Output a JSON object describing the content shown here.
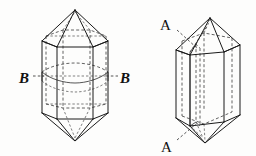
{
  "figure": {
    "background_color": "#fdfdfc",
    "line_color": "#1a1a1a",
    "hidden_line_color": "#3a3a3a",
    "labels": {
      "left_section_left": "B",
      "left_section_right": "B",
      "right_section_top": "A",
      "right_section_bottom": "A"
    },
    "left_crystal": {
      "name": "crystal-with-horizontal-section",
      "section_label": "B",
      "section_orientation": "horizontal",
      "apex_top": [
        75,
        10
      ],
      "apex_bottom": [
        75,
        141
      ],
      "prism_left_outer": 42,
      "prism_right_outer": 108,
      "prism_front_left": 57,
      "prism_front_right": 93,
      "prism_top_y": 41,
      "prism_bottom_y": 113,
      "section_y": 76
    },
    "right_crystal": {
      "name": "crystal-with-vertical-section",
      "section_label": "A",
      "section_orientation": "vertical",
      "apex_top": [
        210,
        18
      ],
      "apex_bottom": [
        205,
        143
      ],
      "prism_left_outer": 176,
      "prism_right_outer": 240,
      "prism_front_left": 190,
      "prism_front_right": 224,
      "prism_top_y": 47,
      "prism_bottom_y": 118,
      "section_x_top": 196,
      "section_x_bottom": 200
    }
  }
}
